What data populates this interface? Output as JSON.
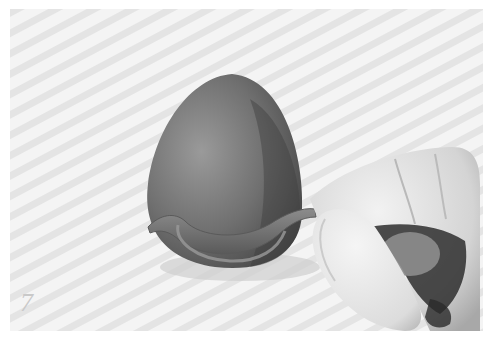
{
  "image": {
    "kind": "instructional craft photo",
    "tone": "grayscale",
    "step_number": "7",
    "subjects": [
      "clay-egg",
      "clay-strip",
      "hand-fingers"
    ],
    "colors": {
      "background": "#ffffff",
      "surface": "#f3f3f3",
      "surface_stripe": "#e2e2e2",
      "clay_light": "#8a8a8a",
      "clay_dark": "#4a4a4a",
      "skin_light": "#e6e6e6",
      "skin_shadow": "#9a9a9a",
      "shadow_dark": "#2a2a2a",
      "step_number": "#c9c9c9"
    }
  }
}
